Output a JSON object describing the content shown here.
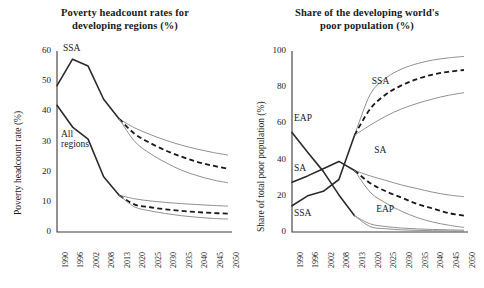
{
  "figure": {
    "width": 484,
    "height": 288,
    "background": "#ffffff",
    "ink_color": "#1a1a1a",
    "projection_band_color": "#8a8a8a"
  },
  "chart_data": [
    {
      "type": "line",
      "panel": "left",
      "title": "Poverty headcount rates for developing regions (%)",
      "xlabel": "",
      "ylabel": "Poverty headcount rate (%)",
      "grid": false,
      "legend": "inline-annotations",
      "x": [
        "1990",
        "1996",
        "2002",
        "2008",
        "2013",
        "2020",
        "2025",
        "2030",
        "2035",
        "2040",
        "2045",
        "2050"
      ],
      "ylim": [
        0,
        60
      ],
      "yticks": [
        0,
        10,
        20,
        30,
        40,
        50,
        60
      ],
      "annotations": [
        {
          "text": "SSA",
          "x": "1990",
          "y": 60
        },
        {
          "text": "All regions",
          "x": "1996",
          "y": 30
        }
      ],
      "series": [
        {
          "name": "SSA historical",
          "style": "solid-dark",
          "x": [
            "1990",
            "1996",
            "2002",
            "2008",
            "2013"
          ],
          "values": [
            48.5,
            57.3,
            55.0,
            44.0,
            37.5
          ]
        },
        {
          "name": "SSA projection upper",
          "style": "thin-gray",
          "x": [
            "2013",
            "2020",
            "2025",
            "2030",
            "2035",
            "2040",
            "2045",
            "2050"
          ],
          "values": [
            37.5,
            34.5,
            32.3,
            30.4,
            28.8,
            27.5,
            26.4,
            25.5
          ]
        },
        {
          "name": "SSA projection central",
          "style": "dashed-bold",
          "x": [
            "2013",
            "2020",
            "2025",
            "2030",
            "2035",
            "2040",
            "2045",
            "2050"
          ],
          "values": [
            37.5,
            32.5,
            29.5,
            27.0,
            25.0,
            23.3,
            22.0,
            21.0
          ]
        },
        {
          "name": "SSA projection lower",
          "style": "thin-gray",
          "x": [
            "2013",
            "2020",
            "2025",
            "2030",
            "2035",
            "2040",
            "2045",
            "2050"
          ],
          "values": [
            37.5,
            30.0,
            26.0,
            23.0,
            20.5,
            18.7,
            17.3,
            16.3
          ]
        },
        {
          "name": "All regions historical",
          "style": "solid-dark",
          "x": [
            "1990",
            "1996",
            "2002",
            "2008",
            "2013"
          ],
          "values": [
            42.0,
            34.8,
            30.8,
            18.3,
            12.2
          ]
        },
        {
          "name": "All regions projection upper",
          "style": "thin-gray",
          "x": [
            "2013",
            "2020",
            "2025",
            "2030",
            "2035",
            "2040",
            "2045",
            "2050"
          ],
          "values": [
            12.2,
            11.0,
            10.3,
            9.8,
            9.4,
            9.1,
            8.8,
            8.6
          ]
        },
        {
          "name": "All regions projection central",
          "style": "dashed-bold",
          "x": [
            "2013",
            "2020",
            "2025",
            "2030",
            "2035",
            "2040",
            "2045",
            "2050"
          ],
          "values": [
            12.2,
            9.1,
            8.2,
            7.5,
            7.0,
            6.6,
            6.3,
            6.1
          ]
        },
        {
          "name": "All regions projection lower",
          "style": "thin-gray",
          "x": [
            "2013",
            "2020",
            "2025",
            "2030",
            "2035",
            "2040",
            "2045",
            "2050"
          ],
          "values": [
            12.2,
            8.3,
            7.0,
            6.1,
            5.4,
            4.9,
            4.5,
            4.3
          ]
        }
      ]
    },
    {
      "type": "line",
      "panel": "right",
      "title": "Share of the developing world's poor population (%)",
      "xlabel": "",
      "ylabel": "Share of total poor population (%)",
      "grid": false,
      "legend": "inline-annotations",
      "x": [
        "1990",
        "1996",
        "2002",
        "2008",
        "2013",
        "2020",
        "2025",
        "2030",
        "2035",
        "2040",
        "2045",
        "2050"
      ],
      "ylim": [
        0,
        100
      ],
      "yticks": [
        0,
        20,
        40,
        60,
        80,
        100
      ],
      "annotations": [
        {
          "text": "SSA",
          "x": "2025",
          "y": 82
        },
        {
          "text": "EAP",
          "x": "1990",
          "y": 61
        },
        {
          "text": "SA",
          "x": "1990",
          "y": 32
        },
        {
          "text": "SA",
          "x": "2022",
          "y": 42
        },
        {
          "text": "EAP",
          "x": "2022",
          "y": 10
        },
        {
          "text": "SSA",
          "x": "1990",
          "y": 9
        }
      ],
      "series": [
        {
          "name": "SSA historical",
          "style": "solid-dark",
          "x": [
            "1990",
            "1996",
            "2002",
            "2008",
            "2013"
          ],
          "values": [
            14.5,
            20.0,
            22.5,
            29.0,
            53.5
          ]
        },
        {
          "name": "SSA projection upper",
          "style": "thin-gray",
          "x": [
            "2013",
            "2020",
            "2025",
            "2030",
            "2035",
            "2040",
            "2045",
            "2050"
          ],
          "values": [
            53.5,
            76.0,
            85.0,
            90.0,
            93.0,
            95.0,
            96.2,
            97.0
          ]
        },
        {
          "name": "SSA projection central",
          "style": "dashed-bold",
          "x": [
            "2013",
            "2020",
            "2025",
            "2030",
            "2035",
            "2040",
            "2045",
            "2050"
          ],
          "values": [
            53.5,
            68.0,
            76.0,
            81.0,
            84.5,
            87.0,
            88.5,
            89.5
          ]
        },
        {
          "name": "SSA projection lower",
          "style": "thin-gray",
          "x": [
            "2013",
            "2020",
            "2025",
            "2030",
            "2035",
            "2040",
            "2045",
            "2050"
          ],
          "values": [
            53.5,
            59.0,
            64.0,
            68.0,
            71.0,
            73.5,
            75.5,
            77.0
          ]
        },
        {
          "name": "SA historical",
          "style": "solid-dark",
          "x": [
            "1990",
            "1996",
            "2002",
            "2008",
            "2013"
          ],
          "values": [
            27.5,
            31.0,
            35.0,
            39.0,
            34.0
          ]
        },
        {
          "name": "SA projection upper",
          "style": "thin-gray",
          "x": [
            "2013",
            "2020",
            "2025",
            "2030",
            "2035",
            "2040",
            "2045",
            "2050"
          ],
          "values": [
            34.0,
            31.0,
            28.5,
            26.0,
            24.0,
            22.0,
            20.5,
            19.5
          ]
        },
        {
          "name": "SA projection central",
          "style": "dashed-bold",
          "x": [
            "2013",
            "2020",
            "2025",
            "2030",
            "2035",
            "2040",
            "2045",
            "2050"
          ],
          "values": [
            34.0,
            27.0,
            22.5,
            19.0,
            15.5,
            13.0,
            10.5,
            9.0
          ]
        },
        {
          "name": "SA projection lower",
          "style": "thin-gray",
          "x": [
            "2013",
            "2020",
            "2025",
            "2030",
            "2035",
            "2040",
            "2045",
            "2050"
          ],
          "values": [
            34.0,
            22.0,
            16.0,
            11.5,
            8.0,
            5.5,
            3.8,
            2.5
          ]
        },
        {
          "name": "EAP historical",
          "style": "solid-dark",
          "x": [
            "1990",
            "1996",
            "2002",
            "2008",
            "2013"
          ],
          "values": [
            55.0,
            44.0,
            33.5,
            20.5,
            9.0
          ]
        },
        {
          "name": "EAP projection upper",
          "style": "thin-gray",
          "x": [
            "2013",
            "2020",
            "2025",
            "2030",
            "2035",
            "2040",
            "2045",
            "2050"
          ],
          "values": [
            9.0,
            4.5,
            3.0,
            2.2,
            1.7,
            1.4,
            1.2,
            1.0
          ]
        },
        {
          "name": "EAP projection lower",
          "style": "thin-gray",
          "x": [
            "2013",
            "2020",
            "2025",
            "2030",
            "2035",
            "2040",
            "2045",
            "2050"
          ],
          "values": [
            9.0,
            3.0,
            1.8,
            1.2,
            0.9,
            0.7,
            0.6,
            0.5
          ]
        }
      ]
    }
  ],
  "panels": {
    "left": {
      "title_line1": "Poverty headcount rates for",
      "title_line2": "developing regions (%)",
      "ylabel": "Poverty headcount rate (%)",
      "yticks": [
        "60",
        "50",
        "40",
        "30",
        "20",
        "10",
        "0"
      ],
      "xticks": [
        "1990",
        "1996",
        "2002",
        "2008",
        "2013",
        "2020",
        "2025",
        "2030",
        "2035",
        "2040",
        "2045",
        "2050"
      ],
      "ann_ssa": "SSA",
      "ann_all_line1": "All",
      "ann_all_line2": "regions"
    },
    "right": {
      "title_line1": "Share of the developing world's",
      "title_line2": "poor population (%)",
      "ylabel": "Share of total poor population (%)",
      "yticks": [
        "100",
        "80",
        "60",
        "40",
        "20",
        "0"
      ],
      "xticks": [
        "1990",
        "1996",
        "2002",
        "2008",
        "2013",
        "2020",
        "2025",
        "2030",
        "2035",
        "2040",
        "2045",
        "2050"
      ],
      "ann_ssa_top": "SSA",
      "ann_eap_left": "EAP",
      "ann_sa_left": "SA",
      "ann_sa_right": "SA",
      "ann_eap_right": "EAP",
      "ann_ssa_bottom": "SSA"
    }
  }
}
